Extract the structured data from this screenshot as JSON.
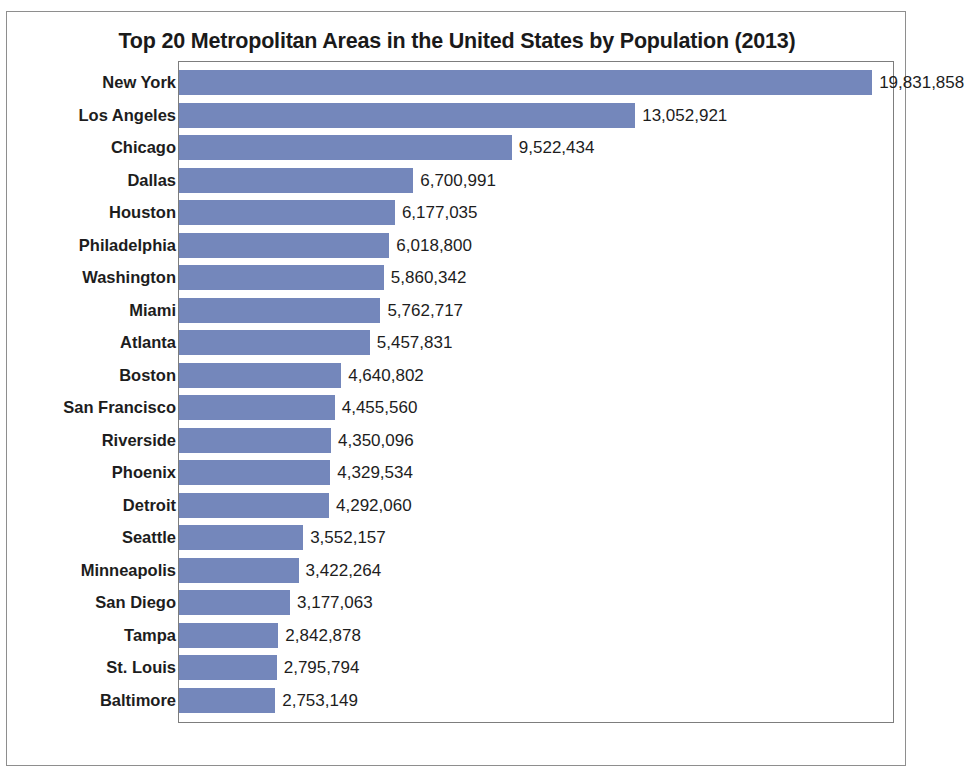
{
  "chart_data": {
    "type": "bar",
    "orientation": "horizontal",
    "title": "Top 20 Metropolitan Areas in the United States by Population (2013)",
    "xlabel": "",
    "ylabel": "",
    "grid": false,
    "legend": "none",
    "axis_visible": false,
    "plot_border": true,
    "bar_color": "#7487bb",
    "value_label_position": "outside-end",
    "value_label_format": "comma-separated integer",
    "xlim": [
      0,
      20400000
    ],
    "categories": [
      "New York",
      "Los Angeles",
      "Chicago",
      "Dallas",
      "Houston",
      "Philadelphia",
      "Washington",
      "Miami",
      "Atlanta",
      "Boston",
      "San Francisco",
      "Riverside",
      "Phoenix",
      "Detroit",
      "Seattle",
      "Minneapolis",
      "San Diego",
      "Tampa",
      "St. Louis",
      "Baltimore"
    ],
    "values": [
      19831858,
      13052921,
      9522434,
      6700991,
      6177035,
      6018800,
      5860342,
      5762717,
      5457831,
      4640802,
      4455560,
      4350096,
      4329534,
      4292060,
      3552157,
      3422264,
      3177063,
      2842878,
      2795794,
      2753149
    ],
    "value_labels": [
      "19,831,858",
      "13,052,921",
      "9,522,434",
      "6,700,991",
      "6,177,035",
      "6,018,800",
      "5,860,342",
      "5,762,717",
      "5,457,831",
      "4,640,802",
      "4,455,560",
      "4,350,096",
      "4,329,534",
      "4,292,060",
      "3,552,157",
      "3,422,264",
      "3,177,063",
      "2,842,878",
      "2,795,794",
      "2,753,149"
    ]
  }
}
